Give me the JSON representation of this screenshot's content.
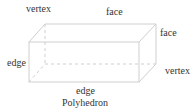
{
  "diagram": {
    "title": "Polyhedron",
    "labels": {
      "vertex_top": "vertex",
      "face_top": "face",
      "face_right": "face",
      "edge_left": "edge",
      "vertex_right": "vertex",
      "edge_bottom": "edge"
    },
    "colors": {
      "solid_edge": "#cfcfcf",
      "hidden_edge": "#cfcfcf",
      "text": "#333333"
    }
  }
}
